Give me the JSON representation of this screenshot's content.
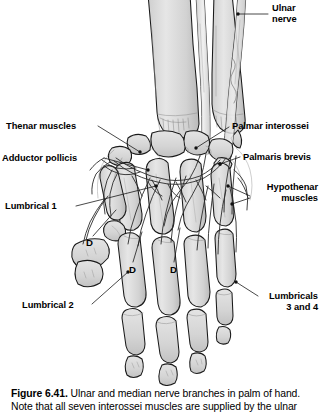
{
  "figure": {
    "illustration_alt": "Line drawing of the palm of the right hand with forearm bones, carpals, metacarpals and phalanges, showing the ulnar and median nerve branches",
    "ink_color": "#1a1a1a",
    "bone_fill": "#d9d9d9",
    "bone_fill_light": "#eaeaea",
    "nerve_color": "#2b2b2b",
    "background": "#ffffff"
  },
  "labels": [
    {
      "id": "ulnar-nerve",
      "name": "label-ulnar-nerve",
      "lines": [
        "Ulnar",
        "nerve"
      ],
      "align": "left",
      "x": 272,
      "y": 3
    },
    {
      "id": "thenar-muscles",
      "name": "label-thenar-muscles",
      "lines": [
        "Thenar muscles"
      ],
      "align": "left",
      "x": 6,
      "y": 121
    },
    {
      "id": "adductor-pollicis",
      "name": "label-adductor-pollicis",
      "lines": [
        "Adductor pollicis"
      ],
      "align": "left",
      "x": 2,
      "y": 153
    },
    {
      "id": "lumbrical-1",
      "name": "label-lumbrical-1",
      "lines": [
        "Lumbrical 1"
      ],
      "align": "left",
      "x": 5,
      "y": 201
    },
    {
      "id": "lumbrical-2",
      "name": "label-lumbrical-2",
      "lines": [
        "Lumbrical 2"
      ],
      "align": "left",
      "x": 22,
      "y": 300
    },
    {
      "id": "palmar-interossei",
      "name": "label-palmar-interossei",
      "lines": [
        "Palmar interossei"
      ],
      "align": "left",
      "x": 232,
      "y": 121
    },
    {
      "id": "palmaris-brevis",
      "name": "label-palmaris-brevis",
      "lines": [
        "Palmaris brevis"
      ],
      "align": "left",
      "x": 243,
      "y": 152
    },
    {
      "id": "hypothenar-muscles",
      "name": "label-hypothenar-muscles",
      "lines": [
        "Hypothenar",
        "muscles"
      ],
      "align": "right",
      "x_right": 318,
      "y": 182
    },
    {
      "id": "lumbricals-3-and-4",
      "name": "label-lumbricals-3-and-4",
      "lines": [
        "Lumbricals",
        "3 and 4"
      ],
      "align": "right",
      "x_right": 318,
      "y": 291
    }
  ],
  "digit_markers": [
    {
      "id": "d-1",
      "name": "digit-marker-d-1",
      "text": "D",
      "x": 86,
      "y": 238
    },
    {
      "id": "d-2",
      "name": "digit-marker-d-2",
      "text": "D",
      "x": 129,
      "y": 265
    },
    {
      "id": "d-3",
      "name": "digit-marker-d-3",
      "text": "D",
      "x": 170,
      "y": 265
    }
  ],
  "caption": {
    "figure_number": "Figure 6.41.",
    "line_1": "Ulnar and median nerve branches in palm of hand.",
    "line_2_clipped": "Note that all seven interossei muscles are supplied by the ulnar"
  }
}
